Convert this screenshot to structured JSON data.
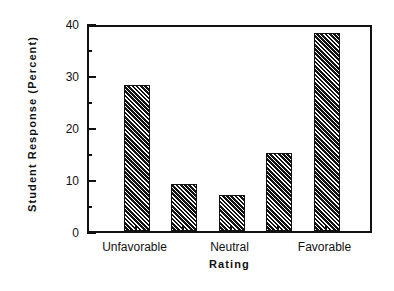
{
  "chart_data": {
    "type": "bar",
    "title": "",
    "subtitle": "",
    "xlabel": "Rating",
    "ylabel": "Student  Response  (Percent)",
    "categories": [
      "Unfavorable",
      "",
      "Neutral",
      "",
      "Favorable"
    ],
    "values": [
      28,
      9,
      7,
      15,
      38
    ],
    "ylim": [
      0,
      40
    ],
    "yticks": [
      0,
      10,
      20,
      30,
      40
    ],
    "ytick_labels": [
      "0",
      "10",
      "20",
      "30",
      "40"
    ],
    "yminor_ticks": [
      5,
      15,
      25,
      35
    ],
    "xtick_labels": [
      "Unfavorable",
      "Neutral",
      "Favorable"
    ],
    "xtick_label_positions": [
      1,
      3,
      5
    ],
    "grid": false,
    "legend": false,
    "bar_fill": "hatched-diagonal",
    "bar_color": "#121212",
    "frame_color": "#111111",
    "background": "#ffffff"
  },
  "axes": {
    "y_axis_title": "Student  Response  (Percent)",
    "x_axis_title": "Rating"
  }
}
